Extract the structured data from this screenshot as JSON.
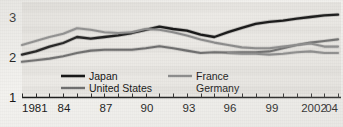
{
  "chart_data": {
    "type": "line",
    "title": "",
    "subtitle": "",
    "xlabel": "",
    "ylabel": "",
    "grid": false,
    "legend_position": "inside-bottom",
    "xlim": [
      1981,
      2004
    ],
    "ylim": [
      1,
      3.25
    ],
    "yticks": [
      1,
      2,
      3
    ],
    "ytick_labels": [
      "1",
      "2",
      "3"
    ],
    "x": [
      1981,
      1982,
      1983,
      1984,
      1985,
      1986,
      1987,
      1988,
      1989,
      1990,
      1991,
      1992,
      1993,
      1994,
      1995,
      1996,
      1997,
      1998,
      1999,
      2000,
      2001,
      2002,
      2003,
      2004
    ],
    "xtick_values": [
      1981,
      1982,
      1983,
      1984,
      1985,
      1986,
      1987,
      1988,
      1989,
      1990,
      1991,
      1992,
      1993,
      1994,
      1995,
      1996,
      1997,
      1998,
      1999,
      2000,
      2001,
      2002,
      2003,
      2004
    ],
    "xtick_labels": [
      "1981",
      "",
      "",
      "84",
      "",
      "",
      "87",
      "",
      "",
      "90",
      "",
      "",
      "93",
      "",
      "",
      "96",
      "",
      "",
      "99",
      "",
      "",
      "2002",
      "",
      "04"
    ],
    "series": [
      {
        "name": "Japan",
        "color": "#171717",
        "width": 2.3,
        "values": [
          2.06,
          2.14,
          2.26,
          2.35,
          2.5,
          2.46,
          2.5,
          2.54,
          2.6,
          2.68,
          2.76,
          2.7,
          2.66,
          2.56,
          2.5,
          2.62,
          2.73,
          2.83,
          2.88,
          2.91,
          2.96,
          3.0,
          3.04,
          3.06
        ]
      },
      {
        "name": "United States",
        "color": "#6e6e6e",
        "width": 2.1,
        "values": [
          1.88,
          1.92,
          1.96,
          2.02,
          2.1,
          2.16,
          2.18,
          2.18,
          2.18,
          2.22,
          2.27,
          2.22,
          2.16,
          2.1,
          2.12,
          2.11,
          2.12,
          2.12,
          2.14,
          2.22,
          2.3,
          2.36,
          2.4,
          2.44
        ]
      },
      {
        "name": "France",
        "color": "#8b8b8b",
        "width": 2.1,
        "values": [
          2.3,
          2.4,
          2.5,
          2.58,
          2.72,
          2.68,
          2.62,
          2.6,
          2.62,
          2.7,
          2.68,
          2.62,
          2.54,
          2.44,
          2.36,
          2.3,
          2.24,
          2.22,
          2.22,
          2.26,
          2.3,
          2.34,
          2.26,
          2.26
        ]
      },
      {
        "name": "Germany",
        "color": "#8b8b8b",
        "width": 2.1,
        "values": [
          null,
          null,
          null,
          null,
          null,
          null,
          null,
          null,
          null,
          null,
          null,
          null,
          null,
          null,
          null,
          2.1,
          2.08,
          2.08,
          2.06,
          2.08,
          2.12,
          2.14,
          2.1,
          2.1
        ]
      }
    ],
    "legend": [
      {
        "label": "Japan",
        "color": "#171717",
        "column": 1
      },
      {
        "label": "United States",
        "color": "#6e6e6e",
        "column": 1
      },
      {
        "label": "France",
        "color": "#8b8b8b",
        "column": 2
      },
      {
        "label": "Germany",
        "color": "#8b8b8b",
        "column": 2
      }
    ]
  },
  "axis": {
    "y_top_label": "3",
    "y_mid_label": "2",
    "y_bottom_label": "1"
  },
  "xaxis": {
    "t1981": "1981",
    "t84": "84",
    "t87": "87",
    "t90": "90",
    "t93": "93",
    "t96": "96",
    "t99": "99",
    "t2002": "2002",
    "t04": "04"
  },
  "legend_text": {
    "japan": "Japan",
    "united_states": "United States",
    "france": "France",
    "germany": "Germany"
  }
}
